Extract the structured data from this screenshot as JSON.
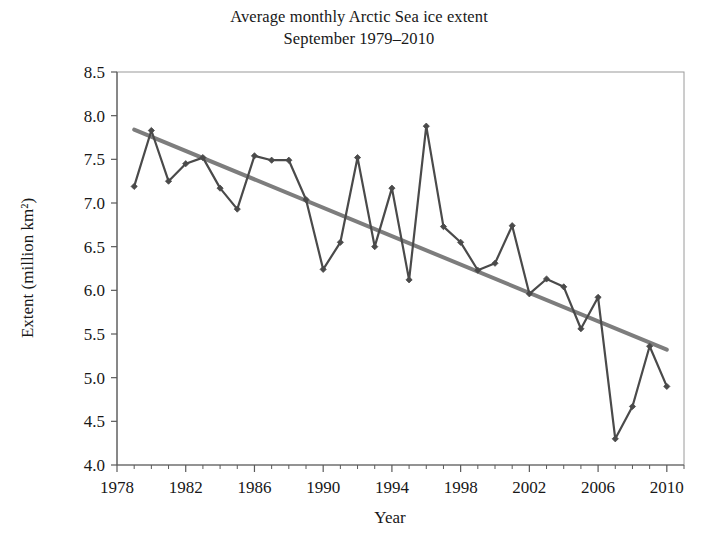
{
  "chart_data": {
    "type": "line",
    "title": "Average monthly Arctic Sea ice extent",
    "subtitle": "September 1979–2010",
    "title_line1": "Average monthly Arctic Sea ice extent",
    "title_line2": "September 1979–2010",
    "xlabel": "Year",
    "ylabel": "Extent (million km²)",
    "xlim": [
      1978,
      2011
    ],
    "ylim": [
      4.0,
      8.5
    ],
    "x_tick_labels": [
      "1978",
      "1982",
      "1986",
      "1990",
      "1994",
      "1998",
      "2002",
      "2006",
      "2010"
    ],
    "x_ticks": [
      1978,
      1982,
      1986,
      1990,
      1994,
      1998,
      2002,
      2006,
      2010
    ],
    "x_minor_tick_step": 1,
    "y_tick_labels": [
      "4.0",
      "4.5",
      "5.0",
      "5.5",
      "6.0",
      "6.5",
      "7.0",
      "7.5",
      "8.0",
      "8.5"
    ],
    "y_ticks": [
      4.0,
      4.5,
      5.0,
      5.5,
      6.0,
      6.5,
      7.0,
      7.5,
      8.0,
      8.5
    ],
    "grid": false,
    "legend": "none",
    "x": [
      1979,
      1980,
      1981,
      1982,
      1983,
      1984,
      1985,
      1986,
      1987,
      1988,
      1989,
      1990,
      1991,
      1992,
      1993,
      1994,
      1995,
      1996,
      1997,
      1998,
      1999,
      2000,
      2001,
      2002,
      2003,
      2004,
      2005,
      2006,
      2007,
      2008,
      2009,
      2010
    ],
    "series": [
      {
        "name": "Arctic sea ice extent",
        "color": "#4a4a4a",
        "marker": "diamond",
        "values": [
          7.19,
          7.83,
          7.25,
          7.45,
          7.52,
          7.17,
          6.93,
          7.54,
          7.49,
          7.49,
          7.04,
          6.24,
          6.55,
          7.52,
          6.5,
          7.17,
          6.12,
          7.88,
          6.73,
          6.55,
          6.23,
          6.31,
          6.74,
          5.96,
          6.13,
          6.04,
          5.56,
          5.92,
          4.3,
          4.67,
          5.36,
          4.9
        ]
      },
      {
        "name": "Linear trend",
        "color": "#7d7d7d",
        "marker": "none",
        "trend_start": {
          "x": 1979,
          "y": 7.84
        },
        "trend_end": {
          "x": 2010,
          "y": 5.32
        }
      }
    ]
  },
  "colors": {
    "data_line": "#4a4a4a",
    "trend_line": "#7d7d7d",
    "axis": "#5a5a5a",
    "text": "#181818",
    "background": "#ffffff"
  }
}
